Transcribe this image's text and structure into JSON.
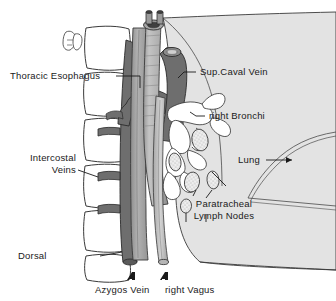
{
  "figure": {
    "background_color": "#ffffff",
    "ink_color": "#1a1a1a"
  },
  "palette": {
    "lung_fill": "#e3e3e3",
    "vessel_dark": "#6e6e6e",
    "trachea_fill": "#b9b9b9",
    "trachea_shadow": "#8f8f8f",
    "esophagus_fill": "#a8a8a8",
    "vertebra_fill": "#ffffff",
    "node_fill": "#efefef",
    "outline": "#2b2b2b"
  },
  "labels": {
    "thoracic_esophagus": "Thoracic Esophagus",
    "intercostal_veins_line1": "Intercostal",
    "intercostal_veins_line2": "Veins",
    "dorsal": "Dorsal",
    "sup_caval_vein": "Sup.Caval Vein",
    "right_bronchi": "right Bronchi",
    "lung": "Lung",
    "paratracheal_line1": "Paratracheal",
    "paratracheal_line2": "Lymph Nodes",
    "azygos_vein": "Azygos Vein",
    "right_vagus": "right Vagus"
  },
  "callout_arrows": {
    "lung_arrow": "→",
    "azygos_arrow": "⇧",
    "vagus_arrow": "⇧"
  },
  "structures": [
    {
      "name": "lung",
      "label_key": "lung",
      "fill": "#e3e3e3"
    },
    {
      "name": "superior-caval-vein",
      "label_key": "sup_caval_vein",
      "fill": "#6e6e6e"
    },
    {
      "name": "azygos-vein",
      "label_key": "azygos_vein",
      "fill": "#6e6e6e"
    },
    {
      "name": "intercostal-veins",
      "label_key": "intercostal_veins_line1",
      "fill": "#6e6e6e"
    },
    {
      "name": "thoracic-esophagus",
      "label_key": "thoracic_esophagus",
      "fill": "#a8a8a8"
    },
    {
      "name": "trachea",
      "label_key": "right_bronchi",
      "fill": "#b9b9b9"
    },
    {
      "name": "right-vagus-nerve",
      "label_key": "right_vagus",
      "fill": "#c9c9c9"
    },
    {
      "name": "paratracheal-lymph-nodes",
      "label_key": "paratracheal_line1",
      "fill": "#efefef"
    },
    {
      "name": "vertebral-bodies",
      "label_key": "dorsal",
      "fill": "#ffffff"
    }
  ]
}
